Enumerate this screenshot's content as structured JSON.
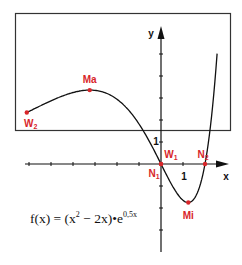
{
  "chart_data": {
    "type": "line",
    "title": "",
    "formula_text": {
      "lhs": "f(x) = (x",
      "exp1": "2",
      "mid": " − 2x)•e",
      "exp2": "0,5x"
    },
    "function": "f(x) = (x^2 - 2x) * e^(0.5x)",
    "xlabel": "x",
    "ylabel": "y",
    "x_tick_labels": [
      "1"
    ],
    "y_tick_labels": [
      "1"
    ],
    "xlim": [
      -6.2,
      3
    ],
    "ylim": [
      -3.9,
      6.2
    ],
    "x_ticks": [
      -6,
      -5,
      -4,
      -3,
      -2,
      -1,
      0,
      1,
      2
    ],
    "y_ticks": [
      -3,
      -2,
      -1,
      0,
      1,
      2,
      3,
      4,
      5
    ],
    "grid": false,
    "series": [
      {
        "name": "f(x)",
        "x": [
          -6.1,
          -6,
          -5,
          -4,
          -3.24,
          -3,
          -2,
          -1,
          0,
          0.5,
          1,
          1.24,
          1.5,
          2,
          2.3,
          2.5
        ],
        "y": [
          2.67,
          2.39,
          2.87,
          3.25,
          3.34,
          3.35,
          2.94,
          1.82,
          0,
          -0.96,
          -1.65,
          -1.06,
          -0.79,
          0,
          1.01,
          1.56
        ]
      }
    ],
    "points": [
      {
        "label": "Ma",
        "name": "maximum",
        "x": -3.24,
        "y": 3.34
      },
      {
        "label": "W",
        "sub": "2",
        "name": "inflection-point-2",
        "x": -6.1,
        "y": 2.67
      },
      {
        "label": "W",
        "sub": "1",
        "name": "inflection-point-1",
        "x": 0,
        "y": 0
      },
      {
        "label": "N",
        "sub": "1",
        "name": "zero-1",
        "x": 0,
        "y": 0
      },
      {
        "label": "N",
        "sub": "2",
        "name": "zero-2",
        "x": 2,
        "y": 0
      },
      {
        "label": "Mi",
        "name": "minimum",
        "x": 1.24,
        "y": -1.06
      }
    ],
    "colors": {
      "curve": "#111111",
      "points": "#d8262a",
      "axes": "#111111",
      "frame": "#333333"
    }
  }
}
